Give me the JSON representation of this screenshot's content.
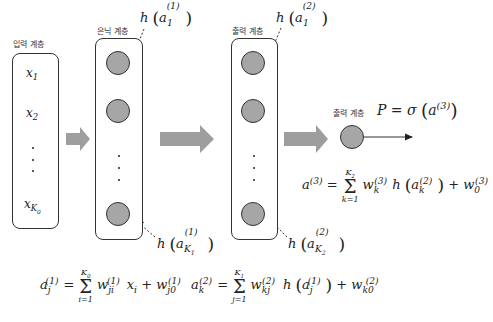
{
  "layers": {
    "input": {
      "label": "입력 계층",
      "units": [
        "x",
        "x",
        "xK0"
      ],
      "unit_subscripts": [
        "1",
        "2",
        "K0"
      ]
    },
    "hidden": {
      "label": "은닉 계층"
    },
    "second": {
      "label": "출력 계층"
    },
    "output": {
      "label": "출력 계층"
    }
  },
  "annotations": {
    "h_a1_1": {
      "fn": "h",
      "var": "a",
      "sub": "1",
      "sup": "(1)"
    },
    "h_aK1_1": {
      "fn": "h",
      "var": "a",
      "sub": "K1",
      "sup": "(1)"
    },
    "h_a1_2": {
      "fn": "h",
      "var": "a",
      "sub": "1",
      "sup": "(2)"
    },
    "h_aK2_2": {
      "fn": "h",
      "var": "a",
      "sub": "K2",
      "sup": "(2)"
    },
    "output_prob": "P = σ(a(3))"
  },
  "equations": {
    "a1": "a_j^(1) = Σ_{i=1}^{K0} w_ji^(1) x_i + w_j0^(1)",
    "a2": "a_k^(2) = Σ_{j=1}^{K1} w_kj^(2) h(a_j^(1)) + w_k0^(2)",
    "a3": "a^(3) = Σ_{k=1}^{K2} w_k^(3) h(a_k^(2)) + w_0^(3)"
  },
  "colors": {
    "node_fill": "#a6a6a6",
    "block_arrow": "#9e9e9e",
    "stroke": "#333333"
  }
}
